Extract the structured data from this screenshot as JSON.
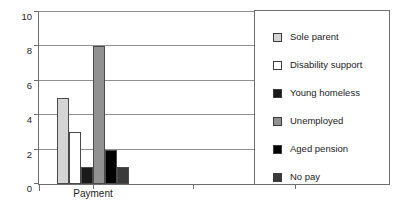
{
  "chart_data": {
    "type": "bar",
    "title": "",
    "xlabel": "",
    "ylabel": "",
    "categories": [
      "Payment"
    ],
    "ylim": [
      0,
      10
    ],
    "yticks": [
      0,
      2,
      4,
      6,
      8,
      10
    ],
    "ytick_labels": [
      "0",
      "2",
      "4",
      "6",
      "8",
      "10"
    ],
    "grid": true,
    "legend_position": "right-inside",
    "series": [
      {
        "name": "Sole parent",
        "values": [
          5
        ],
        "color": "#d4d4d4"
      },
      {
        "name": "Disability support",
        "values": [
          3
        ],
        "color": "#ffffff"
      },
      {
        "name": "Young homeless",
        "values": [
          1
        ],
        "color": "#1a1a1a"
      },
      {
        "name": "Unemployed",
        "values": [
          8
        ],
        "color": "#919191"
      },
      {
        "name": "Aged pension",
        "values": [
          2
        ],
        "color": "#000000"
      },
      {
        "name": "No pay",
        "values": [
          1
        ],
        "color": "#3a3a3a"
      }
    ]
  },
  "axes": {
    "category_label": "Payment",
    "axis_color": "#6e6e6e",
    "grid_color": "#8f8f8f"
  },
  "legend": {
    "items": [
      {
        "label": "Sole parent",
        "color": "#d4d4d4"
      },
      {
        "label": "Disability support",
        "color": "#ffffff"
      },
      {
        "label": "Young homeless",
        "color": "#1a1a1a"
      },
      {
        "label": "Unemployed",
        "color": "#919191"
      },
      {
        "label": "Aged pension",
        "color": "#000000"
      },
      {
        "label": "No pay",
        "color": "#3a3a3a"
      }
    ]
  }
}
